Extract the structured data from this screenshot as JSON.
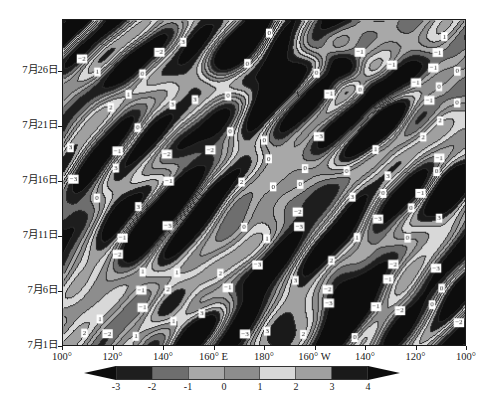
{
  "figure": {
    "kind": "hovmoller-filled-contour",
    "background": "#ffffff",
    "frame_color": "#1a1a1a"
  },
  "chart_data": {
    "type": "heatmap",
    "title": "",
    "subtitle": "",
    "xlabel": "",
    "ylabel": "",
    "grid": false,
    "legend_position": "bottom",
    "x_axis": {
      "label": "",
      "ticks": [
        "100°",
        "120°",
        "140°",
        "160° E",
        "180°",
        "160° W",
        "140°",
        "120°",
        "100°"
      ],
      "tick_positions": [
        0,
        0.125,
        0.25,
        0.375,
        0.5,
        0.625,
        0.75,
        0.875,
        1.0
      ],
      "range_description": "100°E eastward to 180° then to 100°W"
    },
    "y_axis": {
      "label": "",
      "ticks": [
        "7月1日",
        "7月6日",
        "7月11日",
        "7月16日",
        "7月21日",
        "7月26日"
      ],
      "tick_positions": [
        0.0,
        0.168,
        0.336,
        0.504,
        0.672,
        0.84
      ],
      "direction": "bottom-to-top increasing date"
    },
    "colorbar": {
      "ticks": [
        "-3",
        "-2",
        "-1",
        "0",
        "1",
        "2",
        "3",
        "4"
      ],
      "values": [
        -3,
        -2,
        -1,
        0,
        1,
        2,
        3,
        4
      ],
      "levels": [
        -3,
        -2,
        -1,
        0,
        1,
        2,
        3,
        4
      ],
      "extend": "both",
      "extend_color": "#0d0d0d",
      "segment_colors": [
        "#1e1e1e",
        "#6e6e6e",
        "#a8a8a8",
        "#8d8d8d",
        "#d8d8d8",
        "#a0a0a0",
        "#1a1a1a"
      ],
      "segment_ranges": [
        "-3 to -2",
        "-2 to -1",
        "-1 to 0",
        "0 to 1",
        "1 to 2",
        "2 to 3",
        "3 to 4"
      ]
    },
    "contour_label_values": [
      -3,
      -2,
      -1,
      0,
      1,
      2,
      3
    ],
    "contour_line_color": "#2a2a2a",
    "contour_label_style": "white box, dark text",
    "value_range": [
      -4,
      5
    ]
  }
}
